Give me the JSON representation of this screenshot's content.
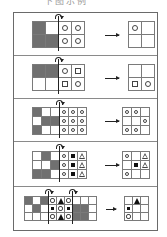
{
  "caption": "下图示例",
  "colors": {
    "dark_cell": "#707070",
    "grid_line": "#7a7a7a",
    "frame": "#6a6a6a",
    "symbol": "#444444",
    "filled": "#111111"
  },
  "panels": [
    {
      "name": "panel-1",
      "top": 0,
      "height": 43,
      "cell": 13,
      "source": {
        "x": 18,
        "y": 8,
        "cols": 4,
        "rows": 2,
        "cells": [
          [
            "dark",
            "white",
            "circle",
            "circle"
          ],
          [
            "dark",
            "dark",
            "circle",
            "circle"
          ]
        ]
      },
      "folds": [
        {
          "col": 2
        }
      ],
      "arrow": {
        "x": 91,
        "y": 22,
        "w": 14
      },
      "result": {
        "x": 114,
        "y": 8,
        "cols": 2,
        "rows": 2,
        "cells": [
          [
            "circle",
            "white"
          ],
          [
            "white",
            "white"
          ]
        ]
      }
    },
    {
      "name": "panel-2",
      "top": 43,
      "height": 43,
      "cell": 13,
      "source": {
        "x": 18,
        "y": 8,
        "cols": 4,
        "rows": 2,
        "cells": [
          [
            "dark",
            "dark",
            "circle",
            "square"
          ],
          [
            "white",
            "white",
            "square",
            "circle"
          ]
        ]
      },
      "folds": [
        {
          "col": 2
        }
      ],
      "arrow": {
        "x": 91,
        "y": 22,
        "w": 14
      },
      "result": {
        "x": 114,
        "y": 8,
        "cols": 2,
        "rows": 2,
        "cells": [
          [
            "white",
            "white"
          ],
          [
            "square",
            "circle"
          ]
        ]
      }
    },
    {
      "name": "panel-3",
      "top": 86,
      "height": 43,
      "cell": 9,
      "source": {
        "x": 18,
        "y": 8,
        "cols": 6,
        "rows": 3,
        "cells": [
          [
            "dark",
            "white",
            "white",
            "circle",
            "circle",
            "circle"
          ],
          [
            "white",
            "dark",
            "dark",
            "circle",
            "circle",
            "circle"
          ],
          [
            "dark",
            "white",
            "white",
            "circle",
            "circle",
            "circle"
          ]
        ]
      },
      "folds": [
        {
          "col": 3
        }
      ],
      "arrow": {
        "x": 91,
        "y": 22,
        "w": 14
      },
      "result": {
        "x": 108,
        "y": 8,
        "cols": 3,
        "rows": 3,
        "cells": [
          [
            "circle",
            "circle",
            "white"
          ],
          [
            "white",
            "white",
            "circle"
          ],
          [
            "circle",
            "circle",
            "white"
          ]
        ]
      }
    },
    {
      "name": "panel-4",
      "top": 129,
      "height": 45,
      "cell": 9,
      "source": {
        "x": 18,
        "y": 9,
        "cols": 6,
        "rows": 3,
        "cells": [
          [
            "white",
            "dark",
            "white",
            "circle",
            "filled-square",
            "triangle"
          ],
          [
            "white",
            "white",
            "dark",
            "circle",
            "filled-square",
            "triangle"
          ],
          [
            "dark",
            "dark",
            "white",
            "circle",
            "filled-square",
            "triangle"
          ]
        ]
      },
      "folds": [
        {
          "col": 3
        }
      ],
      "arrow": {
        "x": 91,
        "y": 23,
        "w": 14
      },
      "result": {
        "x": 108,
        "y": 9,
        "cols": 3,
        "rows": 3,
        "cells": [
          [
            "circle",
            "white",
            "triangle"
          ],
          [
            "white",
            "filled-square",
            "triangle"
          ],
          [
            "circle",
            "white",
            "white"
          ]
        ]
      }
    },
    {
      "name": "panel-5",
      "top": 174,
      "height": 45,
      "cell": 8,
      "source": {
        "x": 10,
        "y": 9,
        "cols": 9,
        "rows": 3,
        "cells": [
          [
            "dark",
            "white",
            "dark",
            "circle",
            "filled-triangle",
            "circle",
            "white",
            "white",
            "white"
          ],
          [
            "white",
            "dark",
            "white",
            "filled-square",
            "circle",
            "filled-square",
            "dark",
            "dark",
            "white"
          ],
          [
            "white",
            "white",
            "white",
            "circle",
            "filled-triangle",
            "circle",
            "dark",
            "dark",
            "white"
          ]
        ]
      },
      "folds": [
        {
          "col": 3
        },
        {
          "col": 6
        }
      ],
      "arrow": {
        "x": 92,
        "y": 22,
        "w": 10
      },
      "result": {
        "x": 110,
        "y": 9,
        "cols": 3,
        "rows": 3,
        "cells": [
          [
            "white",
            "filled-triangle",
            "white"
          ],
          [
            "filled-square",
            "white",
            "white"
          ],
          [
            "circle",
            "white",
            "white"
          ]
        ]
      }
    }
  ]
}
